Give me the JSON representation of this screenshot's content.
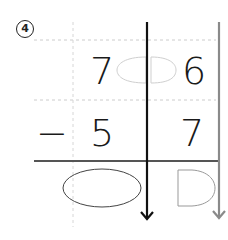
{
  "problem": {
    "number_label": "4",
    "operator": "−",
    "minuend": {
      "tens": "7",
      "ones": "6"
    },
    "subtrahend": {
      "tens": "5",
      "ones": "7"
    }
  },
  "colors": {
    "text": "#1a1a1a",
    "grid_dashed": "#cccccc",
    "tens_divider": "#111111",
    "ones_divider": "#8a8a8a",
    "answer_line": "#555555",
    "borrow_hint": "#cfcfcf",
    "answer_oval": "#444444",
    "answer_d": "#999999"
  }
}
